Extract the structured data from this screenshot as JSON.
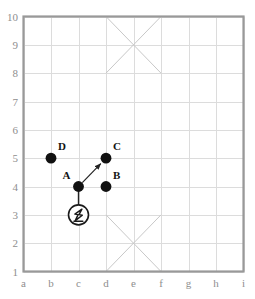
{
  "figure": {
    "title": "",
    "grid_color": "#dcdcdc",
    "border_color": "#999999",
    "cross_color": "#c8c8c8",
    "marker_color": "#111111",
    "arrow_color": "#222222",
    "label_color": "#8e8e8e",
    "point_label_color": "#141414",
    "background": "#ffffff"
  },
  "chart_data": {
    "type": "scatter",
    "title": "",
    "xlabel": "",
    "ylabel": "",
    "grid": true,
    "legend": "none",
    "x_ticks": [
      "a",
      "b",
      "c",
      "d",
      "e",
      "f",
      "g",
      "h",
      "i"
    ],
    "y_ticks": [
      "10",
      "9",
      "8",
      "7",
      "6",
      "5",
      "4",
      "3",
      "2",
      "1"
    ],
    "xlim": [
      "a",
      "i"
    ],
    "ylim": [
      1,
      10
    ],
    "points": [
      {
        "label": "D",
        "x": "b",
        "y": 5,
        "label_pos": "top-right"
      },
      {
        "label": "C",
        "x": "d",
        "y": 5,
        "label_pos": "top-right"
      },
      {
        "label": "A",
        "x": "c",
        "y": 4,
        "label_pos": "top-left"
      },
      {
        "label": "B",
        "x": "d",
        "y": 4,
        "label_pos": "top-right"
      }
    ],
    "arrows": [
      {
        "from": "A",
        "to": "C",
        "style": "arrow",
        "head": "to"
      }
    ],
    "connectors": [
      {
        "from": "A",
        "to": "robot",
        "style": "line",
        "head": "none"
      }
    ],
    "robot": {
      "icon": "circled-robot-icon",
      "x": "c",
      "y": 3
    },
    "crosses": [
      {
        "name": "top-cross",
        "x_from": "d",
        "x_to": "f",
        "y_from": 8,
        "y_to": 10
      },
      {
        "name": "bottom-cross",
        "x_from": "d",
        "x_to": "f",
        "y_from": 1,
        "y_to": 3
      }
    ]
  }
}
